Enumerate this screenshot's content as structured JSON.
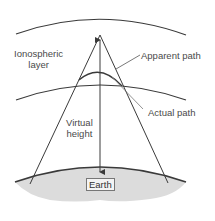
{
  "diagram": {
    "labels": {
      "ionospheric_line1": "Ionospheric",
      "ionospheric_line2": "layer",
      "apparent_path": "Apparent path",
      "actual_path": "Actual path",
      "virtual_line1": "Virtual",
      "virtual_line2": "height",
      "earth": "Earth"
    },
    "colors": {
      "line": "#3a3a3a",
      "earth_fill": "#dcdcdc",
      "text": "#4a4a4a"
    }
  }
}
